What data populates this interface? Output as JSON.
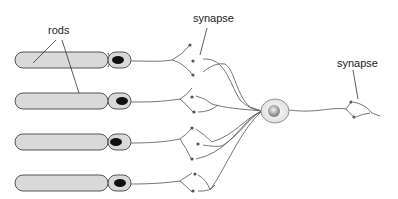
{
  "diagram": {
    "labels": {
      "rods": "rods",
      "synapse_1": "synapse",
      "synapse_2": "synapse"
    },
    "components": {
      "rod_count": 4,
      "cell_body": "ganglion-cell",
      "synapse_dots_color": "#555555",
      "rod_fill": "#d9d9d9",
      "rod_stroke": "#555555",
      "nucleus_color": "#111111"
    }
  }
}
